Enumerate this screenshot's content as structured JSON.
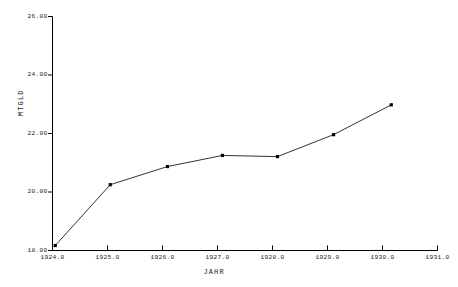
{
  "chart_data": {
    "type": "line",
    "title": "",
    "xlabel": "JAHR",
    "ylabel": "MTGLD",
    "xlim": [
      1924.0,
      1931.0
    ],
    "ylim": [
      18.0,
      26.0
    ],
    "grid": false,
    "legend": "none",
    "marker": "square",
    "line_color": "#000000",
    "xticks": [
      "1924.0",
      "1925.0",
      "1926.0",
      "1927.0",
      "1928.0",
      "1929.0",
      "1930.0",
      "1931.0"
    ],
    "xtick_values": [
      1924.0,
      1925.0,
      1926.0,
      1927.0,
      1928.0,
      1929.0,
      1930.0,
      1931.0
    ],
    "yticks": [
      "18.00",
      "20.00",
      "22.00",
      "24.00",
      "26.00"
    ],
    "ytick_values": [
      18.0,
      20.0,
      22.0,
      24.0,
      26.0
    ],
    "x": [
      1924.05,
      1925.05,
      1926.09,
      1927.09,
      1928.09,
      1929.11,
      1930.16
    ],
    "values": [
      18.17,
      20.25,
      20.87,
      21.25,
      21.21,
      21.96,
      22.98
    ],
    "series": [
      {
        "name": "MTGLD",
        "x": [
          1924.05,
          1925.05,
          1926.09,
          1927.09,
          1928.09,
          1929.11,
          1930.16
        ],
        "values": [
          18.17,
          20.25,
          20.87,
          21.25,
          21.21,
          21.96,
          22.98
        ]
      }
    ]
  }
}
